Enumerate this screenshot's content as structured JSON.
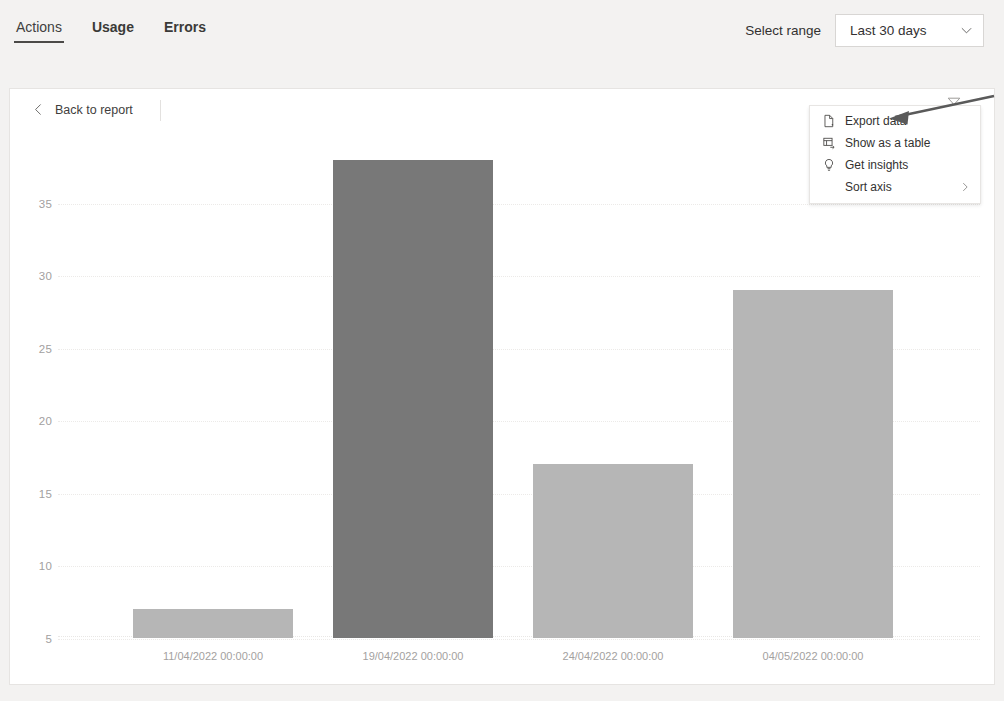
{
  "header": {
    "tabs": [
      {
        "label": "Actions",
        "active": true
      },
      {
        "label": "Usage",
        "active": false
      },
      {
        "label": "Errors",
        "active": false
      }
    ],
    "range_label": "Select range",
    "range_value": "Last 30 days",
    "range_chevron_icon": "chevron-down-icon"
  },
  "card": {
    "back_label": "Back to report",
    "back_icon": "chevron-left-icon",
    "filter_icon": "funnel-icon"
  },
  "context_menu": {
    "items": [
      {
        "label": "Export data",
        "icon": "export-document-icon",
        "submenu": false
      },
      {
        "label": "Show as a table",
        "icon": "table-icon",
        "submenu": false
      },
      {
        "label": "Get insights",
        "icon": "lightbulb-icon",
        "submenu": false
      },
      {
        "label": "Sort axis",
        "icon": "none",
        "submenu": true
      }
    ],
    "submenu_icon": "chevron-right-icon"
  },
  "annotation": {
    "arrow_icon": "pointer-arrow-annotation",
    "target": "Export data"
  },
  "colors": {
    "bar_default": "#b6b6b6",
    "bar_highlight": "#787878",
    "grid": "#eceae8",
    "axis_text": "#a2a0a0",
    "card_bg": "#ffffff",
    "page_bg": "#f3f2f1",
    "tab_underline": "#4b4a48"
  },
  "chart_data": {
    "type": "bar",
    "title": "",
    "xlabel": "",
    "ylabel": "",
    "categories": [
      "11/04/2022 00:00:00",
      "19/04/2022 00:00:00",
      "24/04/2022 00:00:00",
      "04/05/2022 00:00:00"
    ],
    "values": [
      2,
      33,
      12,
      24
    ],
    "highlighted_index": 1,
    "ylim": [
      0,
      35
    ],
    "yticks": [
      0,
      5,
      10,
      15,
      20,
      25,
      30,
      35
    ],
    "grid": true,
    "legend": false
  }
}
